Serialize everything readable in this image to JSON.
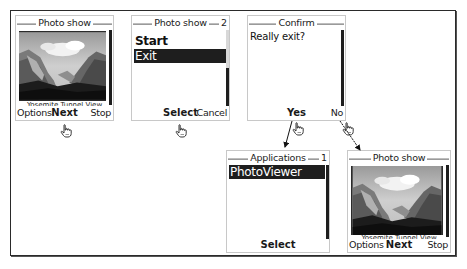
{
  "diagram": {
    "screens": [
      {
        "id": "photo-show-1",
        "title": "Photo show",
        "caption": "Yosemite Tunnel View",
        "softkeys": {
          "left": "Options",
          "middle": "Next",
          "right": "Stop"
        }
      },
      {
        "id": "photo-show-menu",
        "title": "Photo show",
        "count": "2",
        "items": [
          {
            "label": "Start",
            "selected": false
          },
          {
            "label": "Exit",
            "selected": true
          }
        ],
        "softkeys": {
          "left": "",
          "middle": "Select",
          "right": "Cancel"
        }
      },
      {
        "id": "confirm",
        "title": "Confirm",
        "message": "Really exit?",
        "softkeys": {
          "left": "",
          "middle": "Yes",
          "right": "No"
        }
      },
      {
        "id": "applications",
        "title": "Applications",
        "count": "1",
        "items": [
          {
            "label": "PhotoViewer",
            "selected": true
          }
        ],
        "softkeys": {
          "left": "",
          "middle": "Select",
          "right": ""
        }
      },
      {
        "id": "photo-show-2",
        "title": "Photo show",
        "caption": "Yosemite Tunnel View",
        "softkeys": {
          "left": "Options",
          "middle": "Next",
          "right": "Stop"
        }
      }
    ],
    "cursors": [
      {
        "icon": "hand-pointer-icon",
        "target": "Next"
      },
      {
        "icon": "hand-pointer-icon",
        "target": "Select"
      },
      {
        "icon": "hand-pointer-icon",
        "target": "Yes"
      },
      {
        "icon": "hand-pointer-icon",
        "target": "No"
      }
    ],
    "transitions": [
      {
        "from": "Yes",
        "to": "Applications"
      },
      {
        "from": "No",
        "to": "Photo show"
      }
    ],
    "colors": {
      "frame": "#2a2a2a",
      "selection": "#1e1e1e",
      "screen_border": "#c8c8c8"
    }
  }
}
